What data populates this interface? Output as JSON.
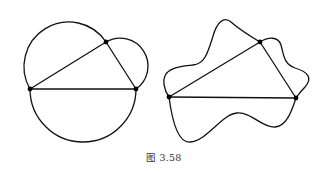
{
  "figure": {
    "caption": "图 3.58",
    "stroke_color": "#111111",
    "background": "#ffffff"
  },
  "left_figure": {
    "description": "Triangle with semicircles drawn on each side",
    "points": {
      "A": [
        30,
        89
      ],
      "B": [
        136,
        89
      ],
      "C": [
        106,
        42
      ]
    }
  },
  "right_figure": {
    "description": "Triangle with irregular closed curve through its vertices",
    "points": {
      "A": [
        169,
        97
      ],
      "B": [
        296,
        98
      ],
      "C": [
        260,
        42
      ]
    }
  }
}
